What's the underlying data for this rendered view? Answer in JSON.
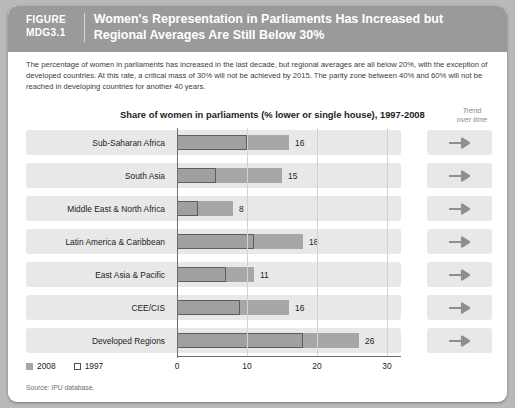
{
  "header": {
    "figure_word": "FIGURE",
    "figure_number": "MDG3.1",
    "title": "Women's Representation in Parliaments Has Increased but Regional Averages Are Still Below 30%"
  },
  "description": "The percentage of women in parliaments has increased in the last decade, but regional averages are all below 20%, with the exception of developed countries. At this rate, a critical mass of 30% will not be achieved by 2015. The parity zone between 40% and 60% will not be reached in developing countries for another 40 years.",
  "trend_header_line1": "Trend",
  "trend_header_line2": "over time",
  "legend": {
    "series_2008": "2008",
    "series_1997": "1997"
  },
  "source": "Source: IPU database.",
  "colors": {
    "banner": "#9a9a9a",
    "bar_2008": "#a7a7a7",
    "bar_1997_border": "#5d5d5d",
    "row_band": "#e8e8e8",
    "page_background": "#b9b9b9",
    "arrow": "#8f8f8f"
  },
  "chart_data": {
    "type": "bar",
    "title": "Share of women in parliaments (% lower or single house), 1997-2008",
    "xlabel": "",
    "ylabel": "",
    "xlim": [
      0,
      30
    ],
    "xticks": [
      0,
      10,
      20,
      30
    ],
    "xtick_labels": [
      "0",
      "10",
      "20",
      "30"
    ],
    "grid": true,
    "orientation": "horizontal",
    "legend_position": "bottom-left",
    "categories": [
      "Sub-Saharan Africa",
      "South Asia",
      "Middle East & North Africa",
      "Latin America & Caribbean",
      "East Asia & Pacific",
      "CEE/CIS",
      "Developed Regions"
    ],
    "series": [
      {
        "name": "2008",
        "style": "filled",
        "values": [
          16,
          15,
          8,
          18,
          11,
          16,
          26
        ],
        "labels": [
          "16",
          "15",
          "8",
          "18",
          "11",
          "16",
          "26"
        ]
      },
      {
        "name": "1997",
        "style": "outlined",
        "values": [
          10,
          5.5,
          3,
          11,
          7,
          9,
          18
        ],
        "labels": [
          "",
          "",
          "",
          "",
          "",
          "",
          ""
        ]
      }
    ],
    "trend": [
      "arrow-right",
      "arrow-right",
      "arrow-right",
      "arrow-right",
      "arrow-right",
      "arrow-right",
      "arrow-right"
    ]
  }
}
